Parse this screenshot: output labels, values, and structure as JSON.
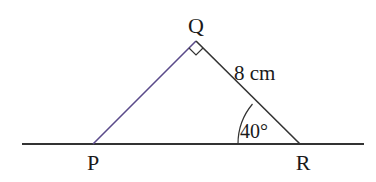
{
  "diagram": {
    "type": "right-triangle",
    "vertices": {
      "P": {
        "label": "P",
        "x": 93,
        "y": 144
      },
      "Q": {
        "label": "Q",
        "x": 196,
        "y": 41
      },
      "R": {
        "label": "R",
        "x": 300,
        "y": 144
      }
    },
    "right_angle_at": "Q",
    "side_QR_label": "8 cm",
    "angle_R_label": "40°",
    "colors": {
      "sides": "#5b4b8a",
      "baseline": "#333333",
      "text": "#1a1a1a"
    }
  }
}
